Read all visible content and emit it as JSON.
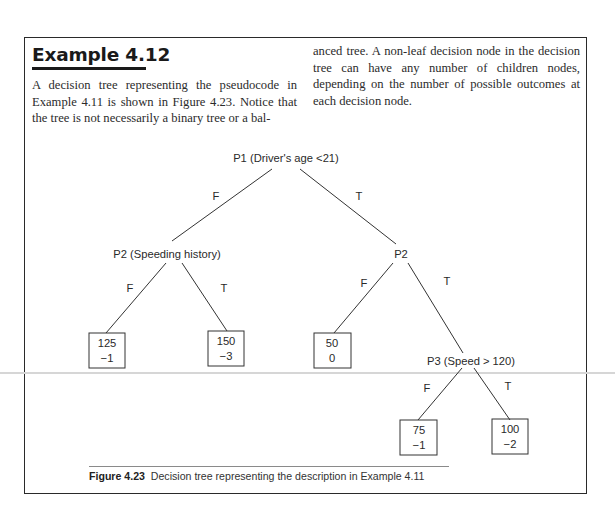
{
  "example": {
    "title": "Example 4.12",
    "paragraph_left": "A decision tree representing the pseudocode in Example 4.11 is shown in Figure 4.23. Notice that the tree is not necessarily a binary tree or a bal-",
    "paragraph_right": "anced tree. A non-leaf decision node in the decision tree can have any number of children nodes, depending on the number of possible outcomes at each decision node."
  },
  "tree": {
    "nodes": {
      "p1": "P1 (Driver's age <21)",
      "p2_left": "P2 (Speeding history)",
      "p2_right": "P2",
      "p3": "P3 (Speed > 120)"
    },
    "edges": {
      "p1_false": "F",
      "p1_true": "T",
      "p2l_false": "F",
      "p2l_true": "T",
      "p2r_false": "F",
      "p2r_true": "T",
      "p3_false": "F",
      "p3_true": "T"
    },
    "leaves": [
      {
        "top": "125",
        "bottom": "−1"
      },
      {
        "top": "150",
        "bottom": "−3"
      },
      {
        "top": "50",
        "bottom": "0"
      },
      {
        "top": "75",
        "bottom": "−1"
      },
      {
        "top": "100",
        "bottom": "−2"
      }
    ]
  },
  "figure": {
    "label": "Figure 4.23",
    "caption": "Decision tree representing the description in Example 4.11"
  }
}
